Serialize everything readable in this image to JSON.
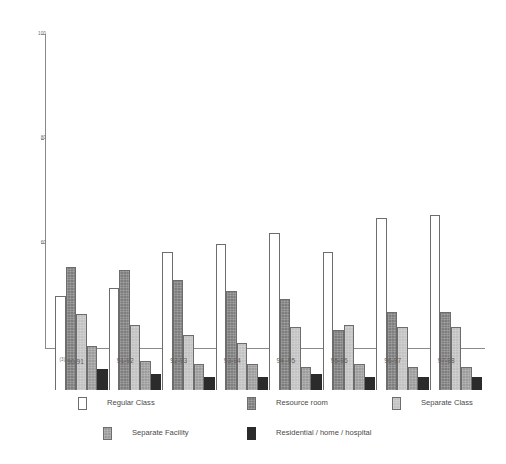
{
  "chart_data": {
    "type": "bar",
    "title": "",
    "subtitle": "",
    "xlabel": "",
    "ylabel": "",
    "ylim": [
      40,
      100
    ],
    "yticks": [
      100,
      80,
      60
    ],
    "ytick_labels": [
      "100",
      "80",
      "60"
    ],
    "grid": false,
    "legend_position": "bottom",
    "categories": [
      "90-91",
      "91-92",
      "92-93",
      "93-94",
      "94 -95",
      "95-96",
      "96-97",
      "97-98"
    ],
    "category_footnote_marker": "(3)",
    "category_footnote_on": "90-91",
    "series": [
      {
        "name": "Regular Class",
        "color": "#ffffff",
        "values": [
          58.0,
          59.5,
          66.5,
          68.0,
          70.0,
          66.5,
          73.0,
          73.5
        ]
      },
      {
        "name": "Resource room",
        "color": "#7e7e7e",
        "values": [
          63.5,
          63.0,
          61.0,
          59.0,
          57.5,
          51.5,
          55.0,
          55.0
        ]
      },
      {
        "name": "Separate Class",
        "color": "#c2c2c2",
        "values": [
          54.5,
          52.5,
          50.5,
          49.0,
          52.0,
          52.5,
          52.0,
          52.0
        ]
      },
      {
        "name": "Separate Facility",
        "color": "#9c9c9c",
        "values": [
          48.5,
          45.5,
          45.0,
          45.0,
          44.5,
          45.0,
          44.5,
          44.5
        ]
      },
      {
        "name": "Residential / home / hospital",
        "color": "#2b2b2b",
        "values": [
          44.0,
          43.0,
          42.5,
          42.5,
          43.0,
          42.5,
          42.5,
          42.5
        ]
      }
    ]
  },
  "legend": {
    "items": [
      {
        "label": "Regular Class",
        "swatch": "s0"
      },
      {
        "label": "Resource room",
        "swatch": "s1"
      },
      {
        "label": "Separate Class",
        "swatch": "s2"
      },
      {
        "label": "Separate Facility",
        "swatch": "s3"
      },
      {
        "label": "Residential / home / hospital",
        "swatch": "s4"
      }
    ]
  }
}
